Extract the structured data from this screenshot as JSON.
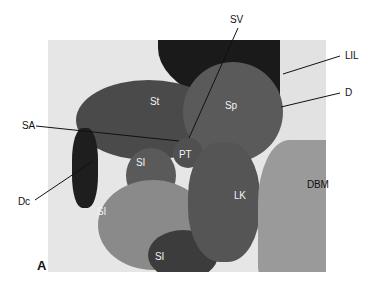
{
  "figure": {
    "panel_letter": "A",
    "image_type": "grayscale MRI, coronal section of left upper abdomen",
    "labels": {
      "SV": "SV",
      "LIL": "LIL",
      "D": "D",
      "SA": "SA",
      "St": "St",
      "Sp": "Sp",
      "PT": "PT",
      "Dc": "Dc",
      "SI_upper": "SI",
      "SI_left": "SI",
      "SI_lower": "SI",
      "LK": "LK",
      "DBM": "DBM"
    }
  }
}
